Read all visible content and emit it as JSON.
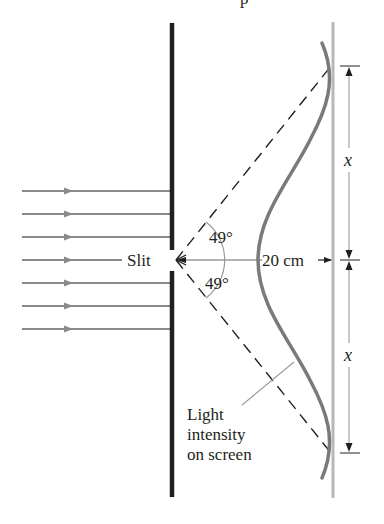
{
  "figure": {
    "top_fragment": "p",
    "slit_label": "Slit",
    "angle_upper": "49°",
    "angle_lower": "49°",
    "distance_label": "20 cm",
    "dimension_upper": "x",
    "dimension_lower": "x",
    "intensity_label": [
      "Light",
      "intensity",
      "on screen"
    ],
    "incident_ray_count": 7,
    "colors": {
      "barrier": "#231f20",
      "rays": "#8a8a8a",
      "intensity_curve": "#7a7a7a",
      "screen": "#b8b8b8",
      "dashed": "#231f20",
      "thin_lines": "#9a9a9a"
    }
  }
}
